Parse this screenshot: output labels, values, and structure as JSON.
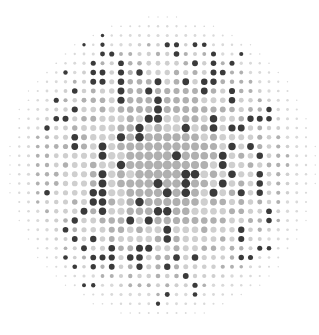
{
  "image": {
    "subject": "halftone dot pattern",
    "description": "Circular field of gray halftone dots with scattered dark dots forming an abstract figure",
    "grid": {
      "rows": 34,
      "cols": 34
    },
    "colors": {
      "background": "#ffffff",
      "dark": "#3a3a3a",
      "mid": "#b0b0b0",
      "light": "#cfcfcf",
      "faint": "#d9d9d9"
    },
    "dark_dots": [
      [
        2,
        10
      ],
      [
        3,
        8
      ],
      [
        3,
        10
      ],
      [
        3,
        17
      ],
      [
        3,
        18
      ],
      [
        3,
        20
      ],
      [
        3,
        21
      ],
      [
        4,
        10
      ],
      [
        4,
        11
      ],
      [
        4,
        18
      ],
      [
        4,
        22
      ],
      [
        4,
        25
      ],
      [
        5,
        9
      ],
      [
        5,
        12
      ],
      [
        5,
        20
      ],
      [
        5,
        22
      ],
      [
        5,
        24
      ],
      [
        6,
        6
      ],
      [
        6,
        9
      ],
      [
        6,
        10
      ],
      [
        6,
        12
      ],
      [
        6,
        14
      ],
      [
        6,
        22
      ],
      [
        6,
        23
      ],
      [
        7,
        9
      ],
      [
        7,
        10
      ],
      [
        7,
        12
      ],
      [
        7,
        16
      ],
      [
        7,
        19
      ],
      [
        7,
        21
      ],
      [
        7,
        22
      ],
      [
        8,
        7
      ],
      [
        8,
        12
      ],
      [
        8,
        15
      ],
      [
        8,
        21
      ],
      [
        8,
        24
      ],
      [
        9,
        5
      ],
      [
        9,
        12
      ],
      [
        9,
        16
      ],
      [
        9,
        24
      ],
      [
        10,
        7
      ],
      [
        10,
        16
      ],
      [
        10,
        28
      ],
      [
        11,
        5
      ],
      [
        11,
        6
      ],
      [
        11,
        15
      ],
      [
        11,
        16
      ],
      [
        11,
        22
      ],
      [
        11,
        26
      ],
      [
        11,
        27
      ],
      [
        11,
        28
      ],
      [
        12,
        4
      ],
      [
        12,
        14
      ],
      [
        12,
        19
      ],
      [
        12,
        22
      ],
      [
        12,
        24
      ],
      [
        12,
        25
      ],
      [
        13,
        7
      ],
      [
        13,
        12
      ],
      [
        13,
        14
      ],
      [
        14,
        7
      ],
      [
        14,
        10
      ],
      [
        14,
        24
      ],
      [
        14,
        26
      ],
      [
        15,
        10
      ],
      [
        15,
        18
      ],
      [
        15,
        23
      ],
      [
        15,
        27
      ],
      [
        16,
        12
      ],
      [
        16,
        23
      ],
      [
        17,
        10
      ],
      [
        17,
        19
      ],
      [
        17,
        20
      ],
      [
        17,
        24
      ],
      [
        17,
        27
      ],
      [
        18,
        10
      ],
      [
        18,
        16
      ],
      [
        18,
        19
      ],
      [
        18,
        23
      ],
      [
        18,
        27
      ],
      [
        19,
        4
      ],
      [
        19,
        9
      ],
      [
        19,
        10
      ],
      [
        19,
        17
      ],
      [
        19,
        19
      ],
      [
        19,
        22
      ],
      [
        19,
        25
      ],
      [
        19,
        27
      ],
      [
        20,
        9
      ],
      [
        20,
        10
      ],
      [
        20,
        14
      ],
      [
        21,
        8
      ],
      [
        21,
        10
      ],
      [
        21,
        16
      ],
      [
        21,
        17
      ],
      [
        21,
        28
      ],
      [
        22,
        7
      ],
      [
        22,
        13
      ],
      [
        22,
        15
      ],
      [
        22,
        28
      ],
      [
        23,
        6
      ],
      [
        23,
        17
      ],
      [
        23,
        25
      ],
      [
        24,
        7
      ],
      [
        24,
        9
      ],
      [
        24,
        17
      ],
      [
        24,
        25
      ],
      [
        25,
        8
      ],
      [
        25,
        11
      ],
      [
        25,
        14
      ],
      [
        25,
        15
      ],
      [
        25,
        27
      ],
      [
        25,
        28
      ],
      [
        26,
        6
      ],
      [
        26,
        9
      ],
      [
        26,
        10
      ],
      [
        26,
        11
      ],
      [
        26,
        13
      ],
      [
        26,
        14
      ],
      [
        26,
        18
      ],
      [
        26,
        20
      ],
      [
        26,
        25
      ],
      [
        26,
        26
      ],
      [
        27,
        7
      ],
      [
        27,
        9
      ],
      [
        27,
        11
      ],
      [
        27,
        14
      ],
      [
        27,
        17
      ],
      [
        28,
        19
      ],
      [
        29,
        8
      ],
      [
        29,
        9
      ],
      [
        29,
        20
      ],
      [
        30,
        17
      ],
      [
        30,
        20
      ],
      [
        31,
        16
      ]
    ],
    "mid_region": [
      [
        8,
        13
      ],
      [
        8,
        14
      ],
      [
        8,
        16
      ],
      [
        8,
        17
      ],
      [
        8,
        18
      ],
      [
        8,
        19
      ],
      [
        9,
        13
      ],
      [
        9,
        14
      ],
      [
        9,
        15
      ],
      [
        9,
        17
      ],
      [
        9,
        18
      ],
      [
        9,
        19
      ],
      [
        9,
        20
      ],
      [
        10,
        12
      ],
      [
        10,
        13
      ],
      [
        10,
        14
      ],
      [
        10,
        15
      ],
      [
        10,
        17
      ],
      [
        10,
        18
      ],
      [
        10,
        19
      ],
      [
        10,
        20
      ],
      [
        10,
        21
      ],
      [
        13,
        15
      ],
      [
        13,
        16
      ],
      [
        13,
        17
      ],
      [
        13,
        18
      ],
      [
        13,
        19
      ],
      [
        13,
        20
      ],
      [
        14,
        13
      ],
      [
        14,
        14
      ],
      [
        14,
        15
      ],
      [
        14,
        16
      ],
      [
        14,
        17
      ],
      [
        14,
        18
      ],
      [
        14,
        19
      ],
      [
        14,
        20
      ],
      [
        14,
        21
      ],
      [
        15,
        13
      ],
      [
        15,
        14
      ],
      [
        15,
        15
      ],
      [
        15,
        16
      ],
      [
        15,
        17
      ],
      [
        15,
        19
      ],
      [
        15,
        20
      ],
      [
        15,
        21
      ],
      [
        16,
        14
      ],
      [
        16,
        15
      ],
      [
        16,
        16
      ],
      [
        16,
        17
      ],
      [
        16,
        18
      ],
      [
        16,
        19
      ],
      [
        16,
        20
      ],
      [
        16,
        21
      ],
      [
        17,
        14
      ],
      [
        17,
        15
      ],
      [
        17,
        16
      ],
      [
        17,
        17
      ],
      [
        17,
        18
      ],
      [
        18,
        13
      ],
      [
        18,
        14
      ],
      [
        18,
        15
      ],
      [
        18,
        17
      ],
      [
        18,
        18
      ],
      [
        19,
        14
      ],
      [
        19,
        15
      ],
      [
        19,
        16
      ],
      [
        19,
        18
      ],
      [
        20,
        15
      ],
      [
        20,
        16
      ],
      [
        20,
        17
      ],
      [
        20,
        18
      ],
      [
        20,
        19
      ],
      [
        20,
        20
      ],
      [
        21,
        13
      ],
      [
        21,
        14
      ],
      [
        21,
        15
      ],
      [
        21,
        18
      ],
      [
        21,
        19
      ],
      [
        22,
        16
      ],
      [
        22,
        17
      ],
      [
        22,
        18
      ],
      [
        22,
        19
      ],
      [
        22,
        20
      ]
    ]
  }
}
